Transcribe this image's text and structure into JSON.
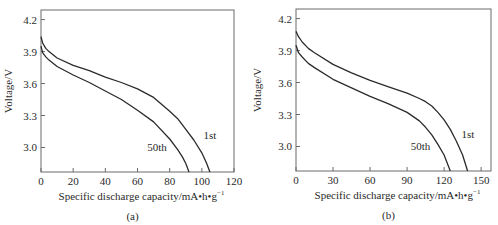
{
  "chart_data": [
    {
      "type": "line",
      "panel_label": "(a)",
      "title": "",
      "xlabel": "Specific discharge capacity/mA•h•g",
      "xlabel_sup": "−1",
      "ylabel": "Voltage/V",
      "xlim": [
        0,
        120
      ],
      "ylim": [
        2.77,
        4.29
      ],
      "xticks": [
        0,
        20,
        40,
        60,
        80,
        100,
        120
      ],
      "yticks": [
        3.0,
        3.3,
        3.6,
        3.9,
        4.2
      ],
      "ytick_labels": [
        "3.0",
        "3.3",
        "3.6",
        "3.9",
        "4.2"
      ],
      "grid": false,
      "legend": "inline labels",
      "series": [
        {
          "name": "1st",
          "label_pos": [
            101,
            3.08
          ],
          "x": [
            0,
            1,
            3,
            5,
            10,
            20,
            30,
            40,
            50,
            60,
            70,
            80,
            85,
            90,
            95,
            100,
            103,
            105
          ],
          "y": [
            4.04,
            3.98,
            3.93,
            3.9,
            3.84,
            3.77,
            3.72,
            3.66,
            3.61,
            3.55,
            3.47,
            3.34,
            3.27,
            3.17,
            3.07,
            2.95,
            2.85,
            2.77
          ]
        },
        {
          "name": "50th",
          "label_pos": [
            66,
            2.97
          ],
          "x": [
            0,
            1,
            3,
            5,
            10,
            20,
            30,
            40,
            50,
            60,
            70,
            80,
            85,
            88,
            90,
            92
          ],
          "y": [
            3.95,
            3.89,
            3.85,
            3.82,
            3.76,
            3.68,
            3.61,
            3.53,
            3.45,
            3.35,
            3.24,
            3.08,
            2.98,
            2.91,
            2.85,
            2.77
          ]
        }
      ]
    },
    {
      "type": "line",
      "panel_label": "(b)",
      "title": "",
      "xlabel": "Specific discharge capacity/mA•h•g",
      "xlabel_sup": "−1",
      "ylabel": "Voltage/V",
      "xlim": [
        0,
        158
      ],
      "ylim": [
        2.77,
        4.29
      ],
      "xticks": [
        0,
        30,
        60,
        90,
        120,
        150
      ],
      "yticks": [
        3.0,
        3.3,
        3.6,
        3.9,
        4.2
      ],
      "ytick_labels": [
        "3.0",
        "3.3",
        "3.6",
        "3.9",
        "4.2"
      ],
      "grid": false,
      "legend": "inline labels",
      "series": [
        {
          "name": "1st",
          "label_pos": [
            134,
            3.08
          ],
          "x": [
            0,
            2,
            5,
            10,
            15,
            30,
            45,
            60,
            75,
            90,
            100,
            105,
            110,
            115,
            120,
            125,
            130,
            135,
            139
          ],
          "y": [
            4.08,
            4.03,
            3.98,
            3.92,
            3.88,
            3.77,
            3.69,
            3.62,
            3.56,
            3.5,
            3.45,
            3.42,
            3.38,
            3.32,
            3.25,
            3.16,
            3.05,
            2.92,
            2.77
          ]
        },
        {
          "name": "50th",
          "label_pos": [
            93,
            2.97
          ],
          "x": [
            0,
            2,
            5,
            10,
            15,
            30,
            45,
            60,
            75,
            90,
            100,
            105,
            110,
            115,
            120,
            125
          ],
          "y": [
            3.95,
            3.88,
            3.84,
            3.78,
            3.74,
            3.63,
            3.55,
            3.47,
            3.4,
            3.32,
            3.24,
            3.18,
            3.11,
            3.02,
            2.92,
            2.77
          ]
        }
      ]
    }
  ],
  "style": {
    "axis_color": "#6a6a6a",
    "line_color": "#2b2b2b",
    "text_color": "#2a2a2a"
  }
}
